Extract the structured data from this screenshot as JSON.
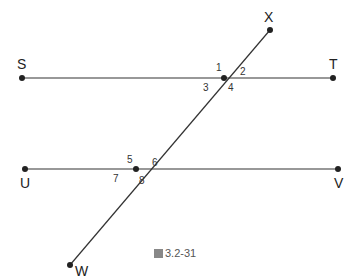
{
  "diagram": {
    "caption": "3.2-31",
    "caption_prefix_icon": "figure-glyph",
    "points": {
      "S": "S",
      "T": "T",
      "U": "U",
      "V": "V",
      "W": "W",
      "X": "X"
    },
    "angles": [
      "1",
      "2",
      "3",
      "4",
      "5",
      "6",
      "7",
      "8"
    ],
    "lines": [
      {
        "name": "ST",
        "from": [
          22,
          78
        ],
        "to": [
          333,
          78
        ]
      },
      {
        "name": "UV",
        "from": [
          25,
          169
        ],
        "to": [
          338,
          169
        ]
      },
      {
        "name": "WX",
        "from": [
          70,
          265
        ],
        "to": [
          270,
          30
        ]
      }
    ],
    "intersections": [
      [
        224,
        78
      ],
      [
        136,
        169
      ]
    ],
    "line_color": "#222222"
  }
}
